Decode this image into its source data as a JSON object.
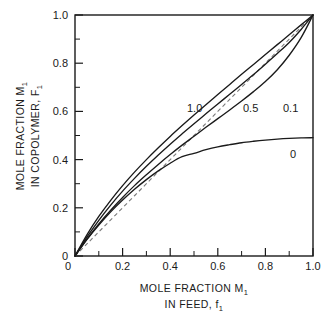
{
  "chart_data": {
    "type": "line",
    "title": "",
    "xlabel": "MOLE FRACTION M1 IN FEED, f1",
    "xlabel_line1": "MOLE FRACTION M",
    "xlabel_line1_sub": "1",
    "xlabel_line2": "IN FEED, f",
    "xlabel_line2_sub": "1",
    "ylabel": "MOLE FRACTION M1 IN COPOLYMER, F1",
    "ylabel_line1": "MOLE FRACTION M",
    "ylabel_line1_sub": "1",
    "ylabel_line2": "IN COPOLYMER, F",
    "ylabel_line2_sub": "1",
    "xlim": [
      0,
      1.0
    ],
    "ylim": [
      0,
      1.0
    ],
    "grid": false,
    "legend_position": "inline-curve-labels",
    "xticks": [
      0,
      0.2,
      0.4,
      0.6,
      0.8,
      1.0
    ],
    "xticklabels": [
      "0",
      "0.2",
      "0.4",
      "0.6",
      "0.8",
      "1.0"
    ],
    "yticks": [
      0,
      0.2,
      0.4,
      0.6,
      0.8,
      1.0
    ],
    "yticklabels": [
      "0",
      "0.2",
      "0.4",
      "0.6",
      "0.8",
      "1.0"
    ],
    "minor_ticks": [
      0.1,
      0.3,
      0.5,
      0.7,
      0.9
    ],
    "x": [
      0,
      0.05,
      0.1,
      0.15,
      0.2,
      0.25,
      0.3,
      0.35,
      0.4,
      0.45,
      0.5,
      0.55,
      0.6,
      0.65,
      0.7,
      0.75,
      0.8,
      0.85,
      0.9,
      0.95,
      1.0
    ],
    "series": [
      {
        "name": "1.0",
        "label": "1.0",
        "style": "solid",
        "values": [
          0,
          0.088,
          0.164,
          0.231,
          0.292,
          0.348,
          0.4,
          0.449,
          0.496,
          0.541,
          0.585,
          0.628,
          0.67,
          0.712,
          0.754,
          0.795,
          0.836,
          0.877,
          0.918,
          0.959,
          1.0
        ]
      },
      {
        "name": "0.5",
        "label": "0.5",
        "style": "solid",
        "values": [
          0,
          0.078,
          0.148,
          0.211,
          0.269,
          0.322,
          0.372,
          0.419,
          0.464,
          0.507,
          0.549,
          0.59,
          0.631,
          0.671,
          0.712,
          0.753,
          0.796,
          0.84,
          0.886,
          0.94,
          1.0
        ]
      },
      {
        "name": "0.1",
        "label": "0.1",
        "style": "solid",
        "values": [
          0,
          0.07,
          0.133,
          0.19,
          0.243,
          0.292,
          0.337,
          0.38,
          0.421,
          0.46,
          0.497,
          0.534,
          0.57,
          0.606,
          0.643,
          0.682,
          0.724,
          0.773,
          0.833,
          0.906,
          1.0
        ]
      },
      {
        "name": "0",
        "label": "0",
        "style": "solid",
        "values": [
          0,
          0.068,
          0.128,
          0.183,
          0.232,
          0.277,
          0.317,
          0.353,
          0.385,
          0.412,
          0.426,
          0.441,
          0.453,
          0.462,
          0.47,
          0.476,
          0.481,
          0.485,
          0.488,
          0.49,
          0.491
        ]
      },
      {
        "name": "azeotropic-diagonal",
        "label": "",
        "style": "dashed",
        "values": [
          0,
          0.05,
          0.1,
          0.15,
          0.2,
          0.25,
          0.3,
          0.35,
          0.4,
          0.45,
          0.5,
          0.55,
          0.6,
          0.65,
          0.7,
          0.75,
          0.8,
          0.85,
          0.9,
          0.95,
          1.0
        ]
      }
    ],
    "annotations": [
      {
        "text": "1.0",
        "x": 0.47,
        "y": 0.645
      },
      {
        "text": "0.5",
        "x": 0.755,
        "y": 0.645
      },
      {
        "text": "0.1",
        "x": 0.915,
        "y": 0.645
      },
      {
        "text": "0",
        "x": 0.915,
        "y": 0.455
      }
    ]
  },
  "colors": {
    "curve": "#1a1a1a",
    "diagonal": "#7a7a7a",
    "axis": "#1a1a1a",
    "background": "#ffffff"
  }
}
